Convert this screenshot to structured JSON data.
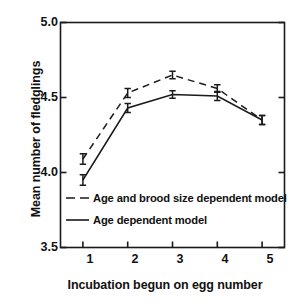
{
  "chart_data": {
    "type": "line",
    "title": "",
    "xlabel": "Incubation begun on egg number",
    "ylabel": "Mean number of fledglings",
    "x": [
      1,
      2,
      3,
      4,
      5
    ],
    "xticklabels": [
      "1",
      "2",
      "3",
      "4",
      "5"
    ],
    "xlim": [
      0.5,
      5.5
    ],
    "yticklabels": [
      "5.0",
      "4.5",
      "4.0",
      "3.5"
    ],
    "yticks": [
      5.0,
      4.5,
      4.0,
      3.5
    ],
    "ylim": [
      3.5,
      5.0
    ],
    "grid": false,
    "legend_position": "lower-left-inside",
    "series": [
      {
        "name": "Age and brood size dependent model",
        "style": "dashed",
        "color": "#1a1a1a",
        "values": [
          4.09,
          4.53,
          4.65,
          4.56,
          4.35
        ],
        "errors": [
          0.035,
          0.03,
          0.025,
          0.025,
          0.03
        ]
      },
      {
        "name": "Age dependent model",
        "style": "solid",
        "color": "#1a1a1a",
        "values": [
          3.95,
          4.43,
          4.52,
          4.51,
          4.35
        ],
        "errors": [
          0.035,
          0.03,
          0.025,
          0.03,
          0.03
        ]
      }
    ]
  },
  "axes": {
    "y_labels": [
      "5.0",
      "4.5",
      "4.0",
      "3.5"
    ],
    "x_labels": [
      "1",
      "2",
      "3",
      "4",
      "5"
    ],
    "y_title": "Mean number of fledglings",
    "x_title": "Incubation begun on egg number"
  },
  "legend": {
    "entries": [
      {
        "label": "Age and brood size dependent model",
        "style": "dashed"
      },
      {
        "label": "Age dependent model",
        "style": "solid"
      }
    ]
  }
}
